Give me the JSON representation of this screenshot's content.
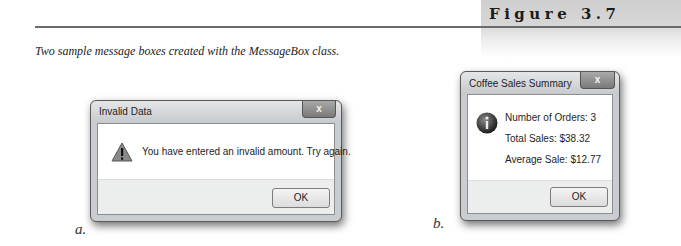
{
  "figure": {
    "label": "Figure 3.7",
    "caption": "Two sample message boxes created with the MessageBox class."
  },
  "dialogs": [
    {
      "sub_label": "a.",
      "title": "Invalid Data",
      "close_glyph": "x",
      "icon": "warning-icon",
      "lines": [
        "You have entered an invalid amount. Try again."
      ],
      "ok_label": "OK"
    },
    {
      "sub_label": "b.",
      "title": "Coffee Sales Summary",
      "close_glyph": "x",
      "icon": "information-icon",
      "lines": [
        "Number of Orders:  3",
        "Total Sales:  $38.32",
        "Average Sale:  $12.77"
      ],
      "ok_label": "OK"
    }
  ]
}
